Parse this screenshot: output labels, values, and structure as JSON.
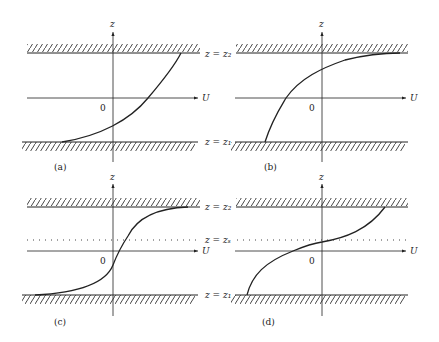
{
  "figure": {
    "panels": [
      {
        "id": "a",
        "caption": "(a)",
        "z_label": "z",
        "u_label": "U",
        "origin_label": "0"
      },
      {
        "id": "b",
        "caption": "(b)",
        "z_label": "z",
        "u_label": "U",
        "origin_label": "0"
      },
      {
        "id": "c",
        "caption": "(c)",
        "z_label": "z",
        "u_label": "U",
        "origin_label": "0"
      },
      {
        "id": "d",
        "caption": "(d)",
        "z_label": "z",
        "u_label": "U",
        "origin_label": "0"
      }
    ],
    "wall_labels": {
      "top": "z = z₂",
      "bottom": "z = z₁",
      "critical": "z = zₛ"
    },
    "colors": {
      "ink": "#222222",
      "background": "#ffffff"
    }
  }
}
